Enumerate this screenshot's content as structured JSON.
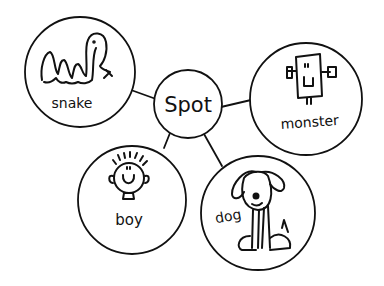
{
  "diagram": {
    "type": "concept-web",
    "center": {
      "label": "Spot",
      "cx": 188,
      "cy": 104,
      "r": 34
    },
    "nodes": [
      {
        "id": "snake",
        "label": "snake",
        "icon": "snake-icon",
        "cx": 80,
        "cy": 72,
        "r": 55
      },
      {
        "id": "monster",
        "label": "monster",
        "icon": "monster-icon",
        "cx": 306,
        "cy": 99,
        "r": 56
      },
      {
        "id": "boy",
        "label": "boy",
        "icon": "boy-face-icon",
        "cx": 132,
        "cy": 200,
        "r": 54
      },
      {
        "id": "dog",
        "label": "dog",
        "icon": "dog-icon",
        "cx": 258,
        "cy": 213,
        "r": 57
      }
    ],
    "colors": {
      "stroke": "#111111",
      "background": "#ffffff"
    }
  }
}
